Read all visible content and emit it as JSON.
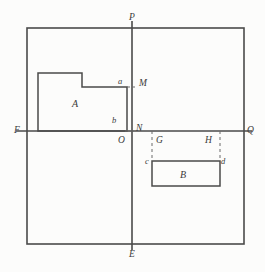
{
  "figure": {
    "type": "geometry-diagram",
    "stroke_color": "#4a4a4a",
    "dash_color": "#6b6b6b",
    "background_color": "#fcfcfb",
    "canvas": {
      "width": 265,
      "height": 272
    }
  },
  "labels": {
    "P": {
      "text": "P",
      "x": 129,
      "y": 13
    },
    "E": {
      "text": "E",
      "x": 129,
      "y": 250
    },
    "F": {
      "text": "F",
      "x": 14,
      "y": 126
    },
    "Q": {
      "text": "Q",
      "x": 247,
      "y": 126
    },
    "O": {
      "text": "O",
      "x": 118,
      "y": 138
    },
    "M": {
      "text": "M",
      "x": 137,
      "y": 78
    },
    "N": {
      "text": "N",
      "x": 136,
      "y": 123
    },
    "G": {
      "text": "G",
      "x": 155,
      "y": 137
    },
    "H": {
      "text": "H",
      "x": 205,
      "y": 137
    },
    "a": {
      "text": "a",
      "x": 118,
      "y": 76
    },
    "b": {
      "text": "b",
      "x": 112,
      "y": 115
    },
    "c": {
      "text": "c",
      "x": 145,
      "y": 157
    },
    "d": {
      "text": "d",
      "x": 221,
      "y": 157
    },
    "A": {
      "text": "A",
      "x": 72,
      "y": 99
    },
    "B": {
      "text": "B",
      "x": 180,
      "y": 171
    }
  },
  "geometry": {
    "outer_square": {
      "left": 27,
      "top": 28,
      "right": 244,
      "bottom": 244
    },
    "horizontal_line_FQ": {
      "x1": 16,
      "y": 131,
      "x2": 252
    },
    "vertical_line_PE": {
      "x": 132,
      "y1": 21,
      "y2": 250
    },
    "region_A_polygon": "38,73 82,73 82,87 127,87 127,131 38,131",
    "region_B_rect": {
      "left": 152,
      "top": 161,
      "right": 220,
      "bottom": 186
    },
    "dash_G": {
      "x": 152,
      "y1": 131,
      "y2": 161
    },
    "dash_H": {
      "x": 220,
      "y1": 131,
      "y2": 161
    },
    "tick_M": {
      "x1": 127,
      "x2": 137,
      "y": 87
    },
    "tick_N": {
      "x1": 127,
      "x2": 134,
      "y": 131
    }
  }
}
